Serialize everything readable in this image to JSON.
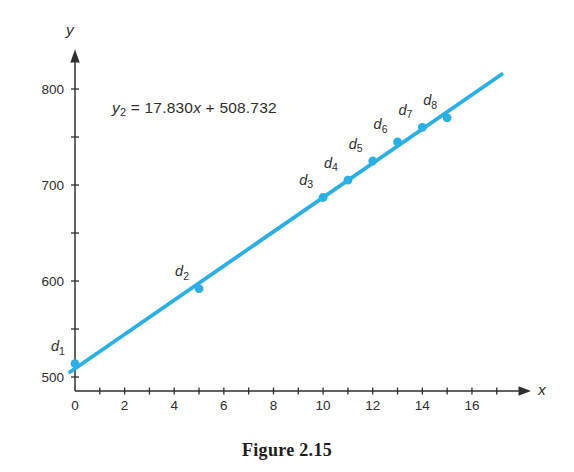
{
  "figure": {
    "caption": "Figure 2.15",
    "equation": {
      "var": "y",
      "var_sub": "2",
      "eq_sign": " = ",
      "coef": "17.830",
      "x_var": "x",
      "plus_sign": " + ",
      "intercept": "508.732"
    }
  },
  "chart_data": {
    "type": "scatter",
    "title": "",
    "equation_label": "y2 = 17.830x + 508.732",
    "fit_line": {
      "slope": 17.83,
      "intercept": 508.732,
      "x_range": [
        -0.2,
        17.2
      ]
    },
    "points": [
      {
        "label": "d1",
        "x": 0,
        "y": 514
      },
      {
        "label": "d2",
        "x": 5,
        "y": 592
      },
      {
        "label": "d3",
        "x": 10,
        "y": 687
      },
      {
        "label": "d4",
        "x": 11,
        "y": 705
      },
      {
        "label": "d5",
        "x": 12,
        "y": 725
      },
      {
        "label": "d6",
        "x": 13,
        "y": 745
      },
      {
        "label": "d7",
        "x": 14,
        "y": 760
      },
      {
        "label": "d8",
        "x": 15,
        "y": 770
      }
    ],
    "x_axis": {
      "label": "x",
      "range": [
        0,
        17.5
      ],
      "labeled_ticks": [
        0,
        2,
        4,
        6,
        8,
        10,
        12,
        14,
        16
      ],
      "minor_ticks": [
        1,
        2,
        3,
        4,
        5,
        6,
        7,
        8,
        9,
        10,
        11,
        12,
        13,
        14,
        15,
        16,
        17
      ]
    },
    "y_axis": {
      "label": "y",
      "range": [
        485,
        830
      ],
      "labeled_ticks": [
        500,
        600,
        700,
        800
      ],
      "minor_ticks": [
        500,
        550,
        600,
        650,
        700,
        750,
        800
      ]
    },
    "colors": {
      "accent": "#2BAFE4",
      "axis": "#2e2e2e",
      "text": "#2e2e2e"
    },
    "legend": "none",
    "grid": false
  }
}
